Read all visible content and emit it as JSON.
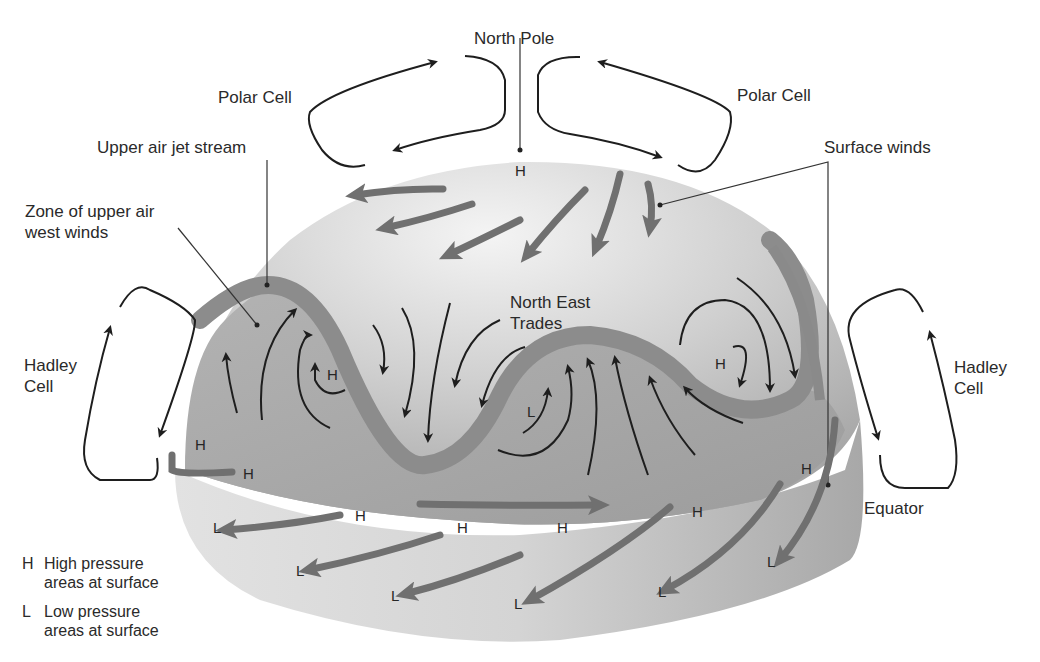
{
  "diagram": {
    "type": "atmospheric-circulation",
    "labels": {
      "north_pole": "North Pole",
      "polar_cell_left": "Polar Cell",
      "polar_cell_right": "Polar Cell",
      "jet_stream": "Upper air jet stream",
      "upper_west_winds_1": "Zone of upper air",
      "upper_west_winds_2": "west winds",
      "surface_winds": "Surface winds",
      "ne_trades_1": "North East",
      "ne_trades_2": "Trades",
      "hadley_left_1": "Hadley",
      "hadley_left_2": "Cell",
      "hadley_right_1": "Hadley",
      "hadley_right_2": "Cell",
      "equator": "Equator"
    },
    "pressure_marks": {
      "pole_h": "H",
      "h1": "H",
      "h2": "H",
      "h3": "H",
      "h4": "H",
      "h5": "H",
      "h6": "H",
      "h7": "H",
      "h8": "H",
      "h9": "H",
      "h10": "H",
      "l1": "L",
      "l2": "L",
      "l3": "L",
      "l4": "L",
      "l5": "L",
      "l6": "L",
      "l7": "L"
    },
    "legend": [
      {
        "key": "H",
        "line1": "High pressure",
        "line2": "areas at surface"
      },
      {
        "key": "L",
        "line1": "Low pressure",
        "line2": "areas at surface"
      }
    ],
    "colors": {
      "background": "#ffffff",
      "dome_light": "#e6e6e6",
      "dome_mid": "#bdbdbd",
      "dome_dark": "#9a9a9a",
      "jet_band": "#8c8c8c",
      "thick_arrow": "#707070",
      "line": "#1e1e1e"
    }
  }
}
